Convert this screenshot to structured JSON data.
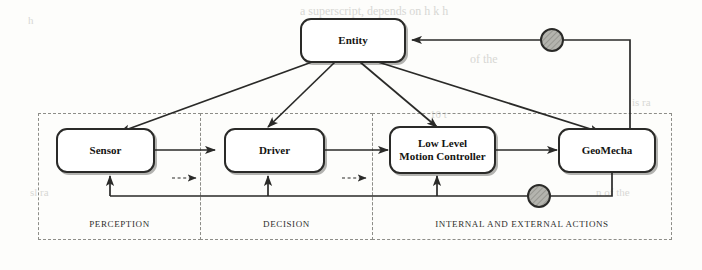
{
  "diagram": {
    "colors": {
      "stroke": "#2a2a28",
      "node_fill": "#ffffff",
      "group_border": "#8d8d88",
      "circle_fill": "#a8a8a2",
      "text": "#141412"
    },
    "entity": {
      "label": "Entity"
    },
    "nodes": [
      {
        "id": "sensor",
        "label": "Sensor",
        "lines": [
          "Sensor"
        ]
      },
      {
        "id": "driver",
        "label": "Driver",
        "lines": [
          "Driver"
        ]
      },
      {
        "id": "controller",
        "label": "Low Level Motion Controller",
        "lines": [
          "Low Level",
          "Motion Controller"
        ]
      },
      {
        "id": "geomecha",
        "label": "GeoMecha",
        "lines": [
          "GeoMecha"
        ]
      }
    ],
    "groups": [
      {
        "id": "perception",
        "label": "PERCEPTION"
      },
      {
        "id": "decision",
        "label": "DECISION"
      },
      {
        "id": "actions",
        "label": "INTERNAL AND EXTERNAL ACTIONS"
      }
    ],
    "junctions": [
      {
        "id": "top-feedback-junction",
        "shape": "shaded-circle"
      },
      {
        "id": "bottom-feedback-junction",
        "shape": "shaded-circle"
      }
    ],
    "edges": [
      {
        "id": "entity-to-sensor",
        "from": "Entity",
        "to": "Sensor",
        "style": "solid"
      },
      {
        "id": "entity-to-driver",
        "from": "Entity",
        "to": "Driver",
        "style": "solid"
      },
      {
        "id": "entity-to-controller",
        "from": "Entity",
        "to": "Low Level Motion Controller",
        "style": "solid"
      },
      {
        "id": "entity-to-geomecha",
        "from": "Entity",
        "to": "GeoMecha",
        "style": "solid"
      },
      {
        "id": "sensor-to-driver",
        "from": "Sensor",
        "to": "Driver",
        "style": "solid"
      },
      {
        "id": "driver-to-controller",
        "from": "Driver",
        "to": "Low Level Motion Controller",
        "style": "solid"
      },
      {
        "id": "controller-to-geomecha",
        "from": "Low Level Motion Controller",
        "to": "GeoMecha",
        "style": "solid"
      },
      {
        "id": "perception-to-decision-dashed",
        "from": "PERCEPTION",
        "to": "DECISION",
        "style": "dashed"
      },
      {
        "id": "decision-to-actions-dashed",
        "from": "DECISION",
        "to": "INTERNAL AND EXTERNAL ACTIONS",
        "style": "dashed"
      },
      {
        "id": "geomecha-to-entity-feedback",
        "from": "GeoMecha",
        "to": "Entity",
        "style": "solid"
      },
      {
        "id": "geomecha-feedback-bus",
        "from": "GeoMecha",
        "to": "Sensor, Driver, Low Level Motion Controller",
        "style": "solid"
      }
    ]
  },
  "background_text": [
    {
      "id": "bleed-1",
      "text": "a superscript, depends on h k h"
    },
    {
      "id": "bleed-2",
      "text": "of the"
    },
    {
      "id": "bleed-3",
      "text": "n of the"
    },
    {
      "id": "bleed-4",
      "text": "10 t"
    },
    {
      "id": "bleed-5",
      "text": "is ra"
    },
    {
      "id": "bleed-6",
      "text": "sl ra"
    },
    {
      "id": "bleed-7",
      "text": "h"
    }
  ]
}
